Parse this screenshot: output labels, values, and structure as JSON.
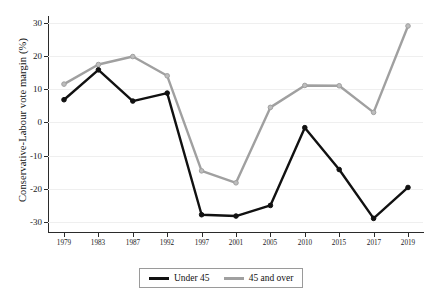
{
  "chart_data": {
    "type": "line",
    "title": "",
    "xlabel": "",
    "ylabel": "Conservative-Labour vote margin (%)",
    "categories": [
      "1979",
      "1983",
      "1987",
      "1992",
      "1997",
      "2001",
      "2005",
      "2010",
      "2015",
      "2017",
      "2019"
    ],
    "ylim": [
      -33,
      32
    ],
    "yticks": [
      30,
      20,
      10,
      0,
      -10,
      -20,
      -30
    ],
    "ytick_labels": [
      "30",
      "20",
      "10",
      "0",
      "-10",
      "-20",
      "-30"
    ],
    "grid": true,
    "legend_position": "bottom-center",
    "series": [
      {
        "name": "Under 45",
        "color": "#111111",
        "values": [
          6.8,
          15.8,
          6.4,
          8.8,
          -27.8,
          -28.2,
          -25.0,
          -1.6,
          -14.2,
          -28.9,
          -19.6
        ]
      },
      {
        "name": "45 and over",
        "color": "#a0a0a0",
        "values": [
          11.5,
          17.4,
          19.8,
          14.0,
          -14.6,
          -18.2,
          4.5,
          11.1,
          11.0,
          3.0,
          29.0
        ]
      }
    ]
  },
  "legend": {
    "items": [
      {
        "label": "Under 45",
        "color": "#111111"
      },
      {
        "label": "45 and over",
        "color": "#a0a0a0"
      }
    ]
  },
  "axes": {
    "y_title": "Conservative-Labour vote margin (%)"
  }
}
